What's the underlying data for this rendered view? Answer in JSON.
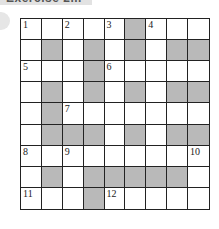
{
  "header": {
    "title": "Exercise 2..."
  },
  "colors": {
    "shaded_cell": "#b9b9b9",
    "grid_line": "#222222",
    "banner": "#e2e2e2"
  },
  "crossword": {
    "rows": 9,
    "cols": 9,
    "layout": [
      "WWWWWWGWWW",
      "WGWGWGWGG",
      "WWWGWWWWW",
      "WGWGWGWGG",
      "WGWWWWWWW",
      "WGGGWGWGG",
      "WWWWWWWWW",
      "WGWGGGGGW",
      "WWWGWWWWW"
    ],
    "grid": [
      [
        "W",
        "W",
        "W",
        "W",
        "W",
        "G",
        "W",
        "W",
        "W"
      ],
      [
        "W",
        "G",
        "W",
        "G",
        "W",
        "G",
        "W",
        "G",
        "G"
      ],
      [
        "W",
        "W",
        "W",
        "G",
        "W",
        "W",
        "W",
        "W",
        "W"
      ],
      [
        "W",
        "G",
        "W",
        "G",
        "W",
        "G",
        "W",
        "G",
        "G"
      ],
      [
        "W",
        "G",
        "W",
        "W",
        "W",
        "W",
        "W",
        "W",
        "W"
      ],
      [
        "W",
        "G",
        "G",
        "G",
        "W",
        "G",
        "W",
        "G",
        "G"
      ],
      [
        "W",
        "W",
        "W",
        "W",
        "W",
        "W",
        "W",
        "W",
        "W"
      ],
      [
        "W",
        "G",
        "W",
        "G",
        "G",
        "G",
        "G",
        "G",
        "W"
      ],
      [
        "W",
        "W",
        "W",
        "G",
        "W",
        "W",
        "W",
        "W",
        "W"
      ]
    ],
    "numbers": [
      {
        "row": 0,
        "col": 0,
        "label": "1"
      },
      {
        "row": 0,
        "col": 2,
        "label": "2"
      },
      {
        "row": 0,
        "col": 4,
        "label": "3"
      },
      {
        "row": 0,
        "col": 6,
        "label": "4"
      },
      {
        "row": 2,
        "col": 0,
        "label": "5"
      },
      {
        "row": 2,
        "col": 4,
        "label": "6"
      },
      {
        "row": 4,
        "col": 2,
        "label": "7"
      },
      {
        "row": 6,
        "col": 0,
        "label": "8"
      },
      {
        "row": 6,
        "col": 2,
        "label": "9"
      },
      {
        "row": 6,
        "col": 8,
        "label": "10"
      },
      {
        "row": 8,
        "col": 0,
        "label": "11"
      },
      {
        "row": 8,
        "col": 4,
        "label": "12"
      }
    ]
  }
}
